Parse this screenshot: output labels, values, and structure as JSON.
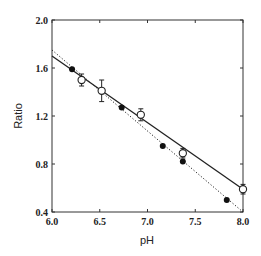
{
  "chart_data": {
    "type": "scatter",
    "title": "",
    "xlabel": "pH",
    "ylabel": "Ratio",
    "xlim": [
      6.0,
      8.0
    ],
    "ylim": [
      0.4,
      2.0
    ],
    "x_ticks": [
      "6.0",
      "6.5",
      "7.0",
      "7.5",
      "8.0"
    ],
    "y_ticks": [
      "0.4",
      "0.8",
      "1.2",
      "1.6",
      "2.0"
    ],
    "grid": false,
    "legend": null,
    "series": [
      {
        "name": "open circles (with error bars)",
        "marker": "open-circle",
        "points": [
          {
            "x": 6.31,
            "y": 1.5,
            "err": 0.05
          },
          {
            "x": 6.52,
            "y": 1.41,
            "err": 0.09
          },
          {
            "x": 6.93,
            "y": 1.21,
            "err": 0.05
          },
          {
            "x": 7.37,
            "y": 0.89,
            "err": 0.04
          },
          {
            "x": 8.0,
            "y": 0.59,
            "err": 0.04
          }
        ],
        "fit_line": {
          "style": "solid",
          "x": [
            6.0,
            8.0
          ],
          "y": [
            1.7,
            0.59
          ]
        }
      },
      {
        "name": "filled circles",
        "marker": "filled-circle",
        "points": [
          {
            "x": 6.21,
            "y": 1.59
          },
          {
            "x": 6.73,
            "y": 1.27
          },
          {
            "x": 7.16,
            "y": 0.95
          },
          {
            "x": 7.37,
            "y": 0.82
          },
          {
            "x": 7.83,
            "y": 0.5
          }
        ],
        "fit_line": {
          "style": "dotted",
          "x": [
            6.0,
            8.0
          ],
          "y": [
            1.75,
            0.4
          ]
        }
      }
    ]
  }
}
